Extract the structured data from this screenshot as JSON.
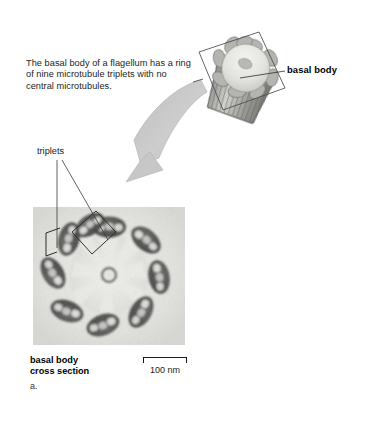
{
  "figure": {
    "panel_letter": "a.",
    "callout_text": "The basal body of a flagellum has a ring of nine microtubule triplets with no central microtubules.",
    "labels": {
      "triplets": "triplets",
      "basal_body": "basal body",
      "caption_line1": "basal body",
      "caption_line2": "cross section"
    },
    "scale_bar": {
      "label": "100 nm",
      "value": 100,
      "unit": "nm"
    },
    "structure": {
      "triplet_count": 9,
      "central_microtubules": 0
    },
    "colors": {
      "background": "#ffffff",
      "text": "#1c1c1c",
      "arrow_fill": "#c9c9c9",
      "arrow_stroke": "#a8a8a8",
      "leader_line": "#3a3a3a",
      "micrograph_light": "#e8e8e6",
      "micrograph_dark": "#3c3c3c",
      "drawing_light": "#e6e6e4",
      "drawing_mid": "#a6a6a6",
      "drawing_dark": "#6e6e6e"
    }
  }
}
